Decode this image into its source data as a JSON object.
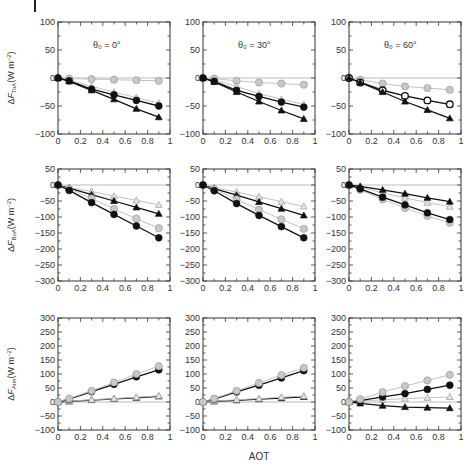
{
  "figure": {
    "xlabel": "AOT",
    "colors": {
      "frame": "#333333",
      "black_marker": "#111111",
      "gray_fill": "#c8c8c8",
      "gray_stroke": "#999999",
      "zero_line": "#aaaaaa",
      "text": "#333333"
    }
  },
  "chart_data": [
    {
      "type": "line",
      "row": 0,
      "col": 0,
      "annotation": "θ0 = 0°",
      "ylabel": "ΔF_ToA (W m⁻²)",
      "ylabel_main": "ΔF",
      "ylabel_sub": "ToA",
      "ylabel_unit": "(W m",
      "xlabel": "",
      "xlim": [
        0,
        1
      ],
      "ylim": [
        -100,
        100
      ],
      "xticks": [
        0,
        0.2,
        0.4,
        0.6,
        0.8,
        1
      ],
      "yticks": [
        -100,
        -50,
        0,
        50,
        100
      ],
      "x": [
        0,
        0.1,
        0.3,
        0.5,
        0.7,
        0.9
      ],
      "series": [
        {
          "name": "gray-circle",
          "marker": "circle",
          "color": "gray",
          "values": [
            0,
            -1,
            -2,
            -3,
            -4,
            -5
          ]
        },
        {
          "name": "gray-triangle",
          "marker": "triangle",
          "color": "gray",
          "values": [
            0,
            -4,
            -15,
            -25,
            -35,
            -45
          ]
        },
        {
          "name": "black-circle",
          "marker": "circle",
          "color": "black",
          "values": [
            0,
            -5,
            -20,
            -30,
            -40,
            -50
          ]
        },
        {
          "name": "black-triangle",
          "marker": "triangle",
          "color": "black",
          "values": [
            0,
            -6,
            -22,
            -38,
            -55,
            -70
          ]
        }
      ]
    },
    {
      "type": "line",
      "row": 0,
      "col": 1,
      "annotation": "θ0 = 30°",
      "ylabel": "",
      "xlabel": "",
      "xlim": [
        0,
        1
      ],
      "ylim": [
        -100,
        100
      ],
      "xticks": [
        0,
        0.2,
        0.4,
        0.6,
        0.8,
        1
      ],
      "yticks": [
        -100,
        -50,
        0,
        50,
        100
      ],
      "x": [
        0,
        0.1,
        0.3,
        0.5,
        0.7,
        0.9
      ],
      "series": [
        {
          "name": "gray-circle",
          "marker": "circle",
          "color": "gray",
          "values": [
            0,
            -1,
            -5,
            -8,
            -10,
            -12
          ]
        },
        {
          "name": "gray-triangle",
          "marker": "triangle",
          "color": "gray",
          "values": [
            0,
            -4,
            -15,
            -28,
            -38,
            -47
          ]
        },
        {
          "name": "black-circle",
          "marker": "circle",
          "color": "black",
          "values": [
            0,
            -6,
            -22,
            -33,
            -43,
            -52
          ]
        },
        {
          "name": "black-triangle",
          "marker": "triangle",
          "color": "black",
          "values": [
            0,
            -7,
            -25,
            -42,
            -58,
            -73
          ]
        }
      ]
    },
    {
      "type": "line",
      "row": 0,
      "col": 2,
      "annotation": "θ0 = 60°",
      "ylabel": "",
      "xlabel": "",
      "xlim": [
        0,
        1
      ],
      "ylim": [
        -100,
        100
      ],
      "xticks": [
        0,
        0.2,
        0.4,
        0.6,
        0.8,
        1
      ],
      "yticks": [
        -100,
        -50,
        0,
        50,
        100
      ],
      "x": [
        0,
        0.1,
        0.3,
        0.5,
        0.7,
        0.9
      ],
      "series": [
        {
          "name": "gray-circle",
          "marker": "circle",
          "color": "gray",
          "values": [
            0,
            -3,
            -10,
            -15,
            -18,
            -21
          ]
        },
        {
          "name": "gray-triangle",
          "marker": "triangle",
          "color": "gray",
          "values": [
            0,
            -7,
            -20,
            -32,
            -40,
            -48
          ]
        },
        {
          "name": "black-circle",
          "marker": "open-circle",
          "color": "black",
          "values": [
            0,
            -8,
            -22,
            -32,
            -40,
            -47
          ]
        },
        {
          "name": "black-triangle",
          "marker": "triangle",
          "color": "black",
          "values": [
            0,
            -8,
            -25,
            -42,
            -57,
            -72
          ]
        }
      ]
    },
    {
      "type": "line",
      "row": 1,
      "col": 0,
      "annotation": "",
      "ylabel": "ΔF_BoA (W m⁻²)",
      "ylabel_main": "ΔF",
      "ylabel_sub": "BoA",
      "ylabel_unit": "(W m",
      "xlabel": "",
      "xlim": [
        0,
        1
      ],
      "ylim": [
        -300,
        50
      ],
      "xticks": [
        0,
        0.2,
        0.4,
        0.6,
        0.8,
        1
      ],
      "yticks": [
        -300,
        -250,
        -200,
        -150,
        -100,
        -50,
        0,
        50
      ],
      "x": [
        0,
        0.1,
        0.3,
        0.5,
        0.7,
        0.9
      ],
      "series": [
        {
          "name": "gray-triangle",
          "marker": "triangle",
          "color": "gray",
          "values": [
            0,
            -8,
            -20,
            -35,
            -48,
            -62
          ]
        },
        {
          "name": "black-triangle",
          "marker": "triangle",
          "color": "black",
          "values": [
            0,
            -10,
            -30,
            -50,
            -70,
            -90
          ]
        },
        {
          "name": "gray-circle",
          "marker": "circle",
          "color": "gray",
          "values": [
            0,
            -12,
            -42,
            -75,
            -105,
            -135
          ]
        },
        {
          "name": "black-circle",
          "marker": "circle",
          "color": "black",
          "values": [
            0,
            -17,
            -55,
            -92,
            -128,
            -165
          ]
        }
      ]
    },
    {
      "type": "line",
      "row": 1,
      "col": 1,
      "annotation": "",
      "ylabel": "",
      "xlabel": "",
      "xlim": [
        0,
        1
      ],
      "ylim": [
        -300,
        50
      ],
      "xticks": [
        0,
        0.2,
        0.4,
        0.6,
        0.8,
        1
      ],
      "yticks": [
        -300,
        -250,
        -200,
        -150,
        -100,
        -50,
        0,
        50
      ],
      "x": [
        0,
        0.1,
        0.3,
        0.5,
        0.7,
        0.9
      ],
      "series": [
        {
          "name": "gray-triangle",
          "marker": "triangle",
          "color": "gray",
          "values": [
            0,
            -8,
            -22,
            -37,
            -52,
            -67
          ]
        },
        {
          "name": "black-triangle",
          "marker": "triangle",
          "color": "black",
          "values": [
            0,
            -11,
            -32,
            -53,
            -74,
            -95
          ]
        },
        {
          "name": "gray-circle",
          "marker": "circle",
          "color": "gray",
          "values": [
            0,
            -13,
            -45,
            -77,
            -107,
            -137
          ]
        },
        {
          "name": "black-circle",
          "marker": "circle",
          "color": "black",
          "values": [
            0,
            -18,
            -58,
            -95,
            -130,
            -165
          ]
        }
      ]
    },
    {
      "type": "line",
      "row": 1,
      "col": 2,
      "annotation": "",
      "ylabel": "",
      "xlabel": "",
      "xlim": [
        0,
        1
      ],
      "ylim": [
        -300,
        50
      ],
      "xticks": [
        0,
        0.2,
        0.4,
        0.6,
        0.8,
        1
      ],
      "yticks": [
        -300,
        -250,
        -200,
        -150,
        -100,
        -50,
        0,
        50
      ],
      "x": [
        0,
        0.1,
        0.3,
        0.5,
        0.7,
        0.9
      ],
      "series": [
        {
          "name": "gray-triangle",
          "marker": "triangle",
          "color": "gray",
          "values": [
            0,
            -6,
            -25,
            -40,
            -55,
            -68
          ]
        },
        {
          "name": "gray-circle",
          "marker": "circle",
          "color": "gray",
          "values": [
            0,
            -15,
            -45,
            -72,
            -97,
            -118
          ]
        },
        {
          "name": "black-circle",
          "marker": "circle",
          "color": "black",
          "values": [
            0,
            -12,
            -38,
            -62,
            -87,
            -108
          ]
        },
        {
          "name": "black-triangle",
          "marker": "triangle",
          "color": "black",
          "values": [
            0,
            -4,
            -15,
            -27,
            -40,
            -52
          ]
        }
      ]
    },
    {
      "type": "line",
      "row": 2,
      "col": 0,
      "annotation": "",
      "ylabel": "ΔF_Atm (W m⁻²)",
      "ylabel_main": "ΔF",
      "ylabel_sub": "Atm",
      "ylabel_unit": "(W m",
      "xlabel": "",
      "xlim": [
        0,
        1
      ],
      "ylim": [
        -100,
        300
      ],
      "xticks": [
        0,
        0.2,
        0.4,
        0.6,
        0.8,
        1
      ],
      "yticks": [
        -100,
        -50,
        0,
        50,
        100,
        150,
        200,
        250,
        300
      ],
      "x": [
        0,
        0.1,
        0.3,
        0.5,
        0.7,
        0.9
      ],
      "series": [
        {
          "name": "black-triangle",
          "marker": "triangle",
          "color": "black",
          "values": [
            0,
            2,
            7,
            11,
            15,
            20
          ]
        },
        {
          "name": "gray-triangle",
          "marker": "triangle",
          "color": "gray",
          "values": [
            0,
            3,
            8,
            12,
            17,
            22
          ]
        },
        {
          "name": "black-circle",
          "marker": "circle",
          "color": "black",
          "values": [
            0,
            10,
            37,
            63,
            90,
            115
          ]
        },
        {
          "name": "gray-circle",
          "marker": "circle",
          "color": "gray",
          "values": [
            0,
            12,
            40,
            70,
            100,
            128
          ]
        }
      ]
    },
    {
      "type": "line",
      "row": 2,
      "col": 1,
      "annotation": "",
      "ylabel": "",
      "xlabel": "AOT",
      "xlim": [
        0,
        1
      ],
      "ylim": [
        -100,
        300
      ],
      "xticks": [
        0,
        0.2,
        0.4,
        0.6,
        0.8,
        1
      ],
      "yticks": [
        -100,
        -50,
        0,
        50,
        100,
        150,
        200,
        250,
        300
      ],
      "x": [
        0,
        0.1,
        0.3,
        0.5,
        0.7,
        0.9
      ],
      "series": [
        {
          "name": "black-triangle",
          "marker": "triangle",
          "color": "black",
          "values": [
            0,
            2,
            6,
            10,
            14,
            18
          ]
        },
        {
          "name": "gray-triangle",
          "marker": "triangle",
          "color": "gray",
          "values": [
            0,
            3,
            8,
            12,
            17,
            21
          ]
        },
        {
          "name": "black-circle",
          "marker": "circle",
          "color": "black",
          "values": [
            0,
            10,
            36,
            60,
            86,
            112
          ]
        },
        {
          "name": "gray-circle",
          "marker": "circle",
          "color": "gray",
          "values": [
            0,
            12,
            40,
            68,
            96,
            122
          ]
        }
      ]
    },
    {
      "type": "line",
      "row": 2,
      "col": 2,
      "annotation": "",
      "ylabel": "",
      "xlabel": "",
      "xlim": [
        0,
        1
      ],
      "ylim": [
        -100,
        300
      ],
      "xticks": [
        0,
        0.2,
        0.4,
        0.6,
        0.8,
        1
      ],
      "yticks": [
        -100,
        -50,
        0,
        50,
        100,
        150,
        200,
        250,
        300
      ],
      "x": [
        0,
        0.1,
        0.3,
        0.5,
        0.7,
        0.9
      ],
      "series": [
        {
          "name": "gray-triangle",
          "marker": "triangle",
          "color": "gray",
          "values": [
            0,
            3,
            8,
            12,
            15,
            18
          ]
        },
        {
          "name": "black-triangle",
          "marker": "triangle",
          "color": "black",
          "values": [
            0,
            -5,
            -13,
            -18,
            -20,
            -22
          ]
        },
        {
          "name": "black-circle",
          "marker": "circle",
          "color": "black",
          "values": [
            0,
            5,
            18,
            30,
            45,
            60
          ]
        },
        {
          "name": "gray-circle",
          "marker": "circle",
          "color": "gray",
          "values": [
            0,
            10,
            35,
            57,
            77,
            97
          ]
        }
      ]
    }
  ]
}
